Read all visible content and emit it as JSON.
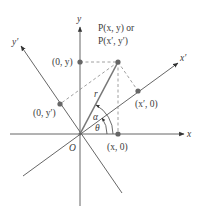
{
  "diagram": {
    "colors": {
      "axis": "#555555",
      "radius": "#777777",
      "dashed": "#888888",
      "point": "#666666",
      "text": "#3a3a3a"
    },
    "axes": {
      "x_label": "x",
      "y_label": "y",
      "x_prime_label": "x′",
      "y_prime_label": "y′",
      "origin_label": "O"
    },
    "point": {
      "label_line1": "P(x, y) or",
      "label_line2": "P(x′, y′)"
    },
    "projections": {
      "on_y": "(0, y)",
      "on_x": "(x, 0)",
      "on_x_prime": "(x′, 0)",
      "on_y_prime": "(0, y′)"
    },
    "angles": {
      "theta": "θ",
      "alpha": "α"
    },
    "segment_label": "r"
  }
}
